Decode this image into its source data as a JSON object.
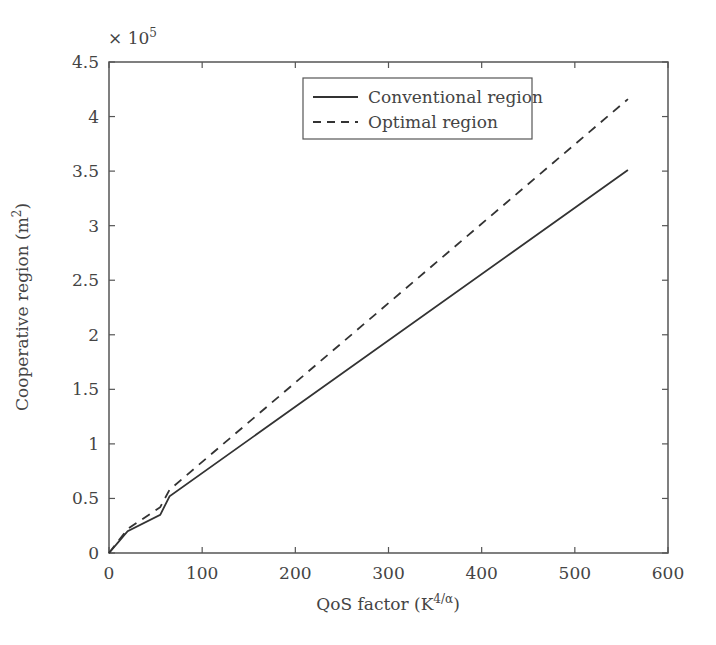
{
  "chart_data": {
    "type": "line",
    "title": "",
    "xlabel": "QoS factor (K^{4/α})",
    "xlabel_main": "QoS factor (K",
    "xlabel_sup": "4/α",
    "xlabel_end": ")",
    "ylabel": "Cooperative region (m^2)",
    "ylabel_main": "Cooperative region (m",
    "ylabel_sup": "2",
    "ylabel_end": ")",
    "y_multiplier": "× 10",
    "y_multiplier_exp": "5",
    "xlim": [
      0,
      600
    ],
    "ylim": [
      0,
      4.5
    ],
    "xticks": [
      "0",
      "100",
      "200",
      "300",
      "400",
      "500",
      "600"
    ],
    "yticks": [
      "0",
      "0.5",
      "1",
      "1.5",
      "2",
      "2.5",
      "3",
      "3.5",
      "4",
      "4.5"
    ],
    "grid": false,
    "legend_position": "upper center",
    "series": [
      {
        "name": "Conventional region",
        "style": "solid",
        "x": [
          0,
          10,
          20,
          55,
          65,
          557
        ],
        "y": [
          0,
          0.1,
          0.2,
          0.35,
          0.52,
          3.51
        ]
      },
      {
        "name": "Optimal region",
        "style": "dashed",
        "x": [
          0,
          10,
          20,
          55,
          65,
          557
        ],
        "y": [
          0,
          0.11,
          0.22,
          0.42,
          0.58,
          4.16
        ]
      }
    ]
  }
}
